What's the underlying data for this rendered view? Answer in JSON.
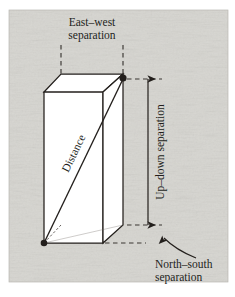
{
  "figure": {
    "background_color": "#dcdbd7",
    "ink_color": "#231f1c",
    "box_fill": "#ffffff",
    "labels": {
      "east_west_line1": "East–west",
      "east_west_line2": "separation",
      "up_down": "Up–down separation",
      "north_south_line1": "North–south",
      "north_south_line2": "separation",
      "distance": "Distance"
    },
    "geometry": {
      "frame": {
        "x": 9,
        "y": 10,
        "width": 219,
        "height": 272
      },
      "box": {
        "front_top_left": [
          44,
          92
        ],
        "front_top_right": [
          103,
          92
        ],
        "front_bottom_left": [
          44,
          243
        ],
        "front_bottom_right": [
          103,
          243
        ],
        "back_top_left": [
          61,
          74
        ],
        "back_top_right": [
          123,
          74
        ],
        "back_bottom_left": [
          61,
          225
        ],
        "back_bottom_right": [
          123,
          225
        ]
      },
      "endpoint_a": [
        44,
        243
      ],
      "endpoint_b": [
        123,
        79
      ],
      "dashed_vertical_left_x": 61,
      "dashed_vertical_right_x": 123,
      "dashed_vertical_top_y": 45,
      "updown_arrow_x": 148,
      "updown_arrow_top_y": 79,
      "updown_arrow_bottom_y": 225
    }
  }
}
